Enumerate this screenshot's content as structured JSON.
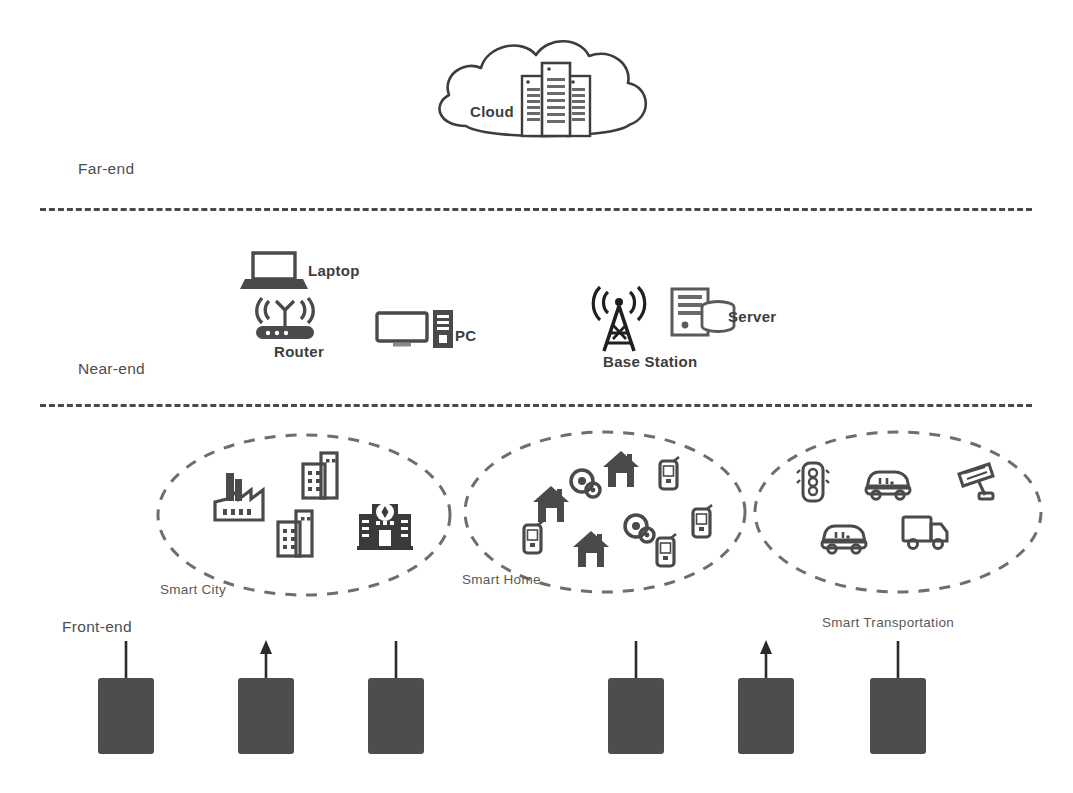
{
  "diagram": {
    "background": "#ffffff",
    "stroke_color": "#3d3d3d",
    "fill_dark": "#4d4d4d",
    "divider_color": "#4a4a4a"
  },
  "tiers": [
    {
      "id": "far-end",
      "label": "Far-end",
      "x": 78,
      "y": 160
    },
    {
      "id": "near-end",
      "label": "Near-end",
      "x": 78,
      "y": 360
    },
    {
      "id": "front-end",
      "label": "Front-end",
      "x": 62,
      "y": 618
    }
  ],
  "dividers": [
    {
      "id": "divider-far-near",
      "x": 40,
      "y": 208,
      "width": 992
    },
    {
      "id": "divider-near-front",
      "x": 40,
      "y": 404,
      "width": 992
    }
  ],
  "far_end": {
    "cloud": {
      "label": "Cloud",
      "label_x": 470,
      "label_y": 105,
      "icon": "cloud-server-icon",
      "cx": 545,
      "cy": 100
    }
  },
  "near_end": {
    "devices": [
      {
        "id": "laptop",
        "label": "Laptop",
        "icon": "laptop-icon",
        "icon_x": 243,
        "icon_y": 251,
        "label_x": 308,
        "label_y": 273
      },
      {
        "id": "router",
        "label": "Router",
        "icon": "router-icon",
        "icon_x": 252,
        "icon_y": 298,
        "label_x": 274,
        "label_y": 354
      },
      {
        "id": "pc",
        "label": "PC",
        "icon": "pc-icon",
        "icon_x": 375,
        "icon_y": 310,
        "label_x": 455,
        "label_y": 338
      },
      {
        "id": "base-station",
        "label": "Base Station",
        "icon": "base-station-icon",
        "icon_x": 588,
        "icon_y": 289,
        "label_x": 603,
        "label_y": 364
      },
      {
        "id": "server",
        "label": "Server",
        "icon": "server-icon",
        "icon_x": 670,
        "icon_y": 287,
        "label_x": 728,
        "label_y": 319
      }
    ]
  },
  "front_end": {
    "zones": [
      {
        "id": "smart-city",
        "label": "Smart City",
        "label_x": 160,
        "label_y": 595,
        "ellipse": {
          "cx": 304,
          "cy": 515,
          "rx": 146,
          "ry": 80
        },
        "icons": [
          {
            "name": "factory-icon",
            "x": 212,
            "y": 468,
            "size": 54
          },
          {
            "name": "office-building-icon",
            "x": 300,
            "y": 450,
            "size": 52
          },
          {
            "name": "office-building-icon",
            "x": 275,
            "y": 508,
            "size": 52
          },
          {
            "name": "government-building-icon",
            "x": 357,
            "y": 492,
            "size": 56
          }
        ]
      },
      {
        "id": "smart-home",
        "label": "Smart Home",
        "label_x": 462,
        "label_y": 585,
        "ellipse": {
          "cx": 605,
          "cy": 512,
          "rx": 140,
          "ry": 80
        },
        "icons": [
          {
            "name": "house-icon",
            "x": 530,
            "y": 483,
            "size": 42
          },
          {
            "name": "house-icon",
            "x": 600,
            "y": 448,
            "size": 42
          },
          {
            "name": "house-icon",
            "x": 570,
            "y": 528,
            "size": 42
          },
          {
            "name": "webcam-icon",
            "x": 569,
            "y": 468,
            "size": 32
          },
          {
            "name": "webcam-icon",
            "x": 623,
            "y": 513,
            "size": 32
          },
          {
            "name": "mobile-phone-icon",
            "x": 657,
            "y": 457,
            "size": 28
          },
          {
            "name": "mobile-phone-icon",
            "x": 690,
            "y": 505,
            "size": 28
          },
          {
            "name": "mobile-phone-icon",
            "x": 654,
            "y": 534,
            "size": 28
          },
          {
            "name": "mobile-phone-icon",
            "x": 521,
            "y": 521,
            "size": 28
          }
        ]
      },
      {
        "id": "smart-transportation",
        "label": "Smart Transportation",
        "label_x": 822,
        "label_y": 628,
        "ellipse": {
          "cx": 898,
          "cy": 512,
          "rx": 143,
          "ry": 80
        },
        "icons": [
          {
            "name": "traffic-light-icon",
            "x": 795,
            "y": 460,
            "size": 46
          },
          {
            "name": "car-icon",
            "x": 862,
            "y": 458,
            "size": 50
          },
          {
            "name": "cctv-camera-icon",
            "x": 955,
            "y": 460,
            "size": 46
          },
          {
            "name": "car-icon",
            "x": 818,
            "y": 512,
            "size": 50
          },
          {
            "name": "truck-icon",
            "x": 900,
            "y": 505,
            "size": 54
          }
        ]
      }
    ],
    "nodes": [
      {
        "id": "node-1",
        "x": 98,
        "y": 678,
        "w": 56,
        "h": 76,
        "stem": "line",
        "stem_top": 641
      },
      {
        "id": "node-2",
        "x": 238,
        "y": 678,
        "w": 56,
        "h": 76,
        "stem": "arrow",
        "stem_top": 648
      },
      {
        "id": "node-3",
        "x": 368,
        "y": 678,
        "w": 56,
        "h": 76,
        "stem": "line",
        "stem_top": 641
      },
      {
        "id": "node-4",
        "x": 608,
        "y": 678,
        "w": 56,
        "h": 76,
        "stem": "line",
        "stem_top": 641
      },
      {
        "id": "node-5",
        "x": 738,
        "y": 678,
        "w": 56,
        "h": 76,
        "stem": "arrow",
        "stem_top": 648
      },
      {
        "id": "node-6",
        "x": 870,
        "y": 678,
        "w": 56,
        "h": 76,
        "stem": "line",
        "stem_top": 641
      }
    ]
  }
}
